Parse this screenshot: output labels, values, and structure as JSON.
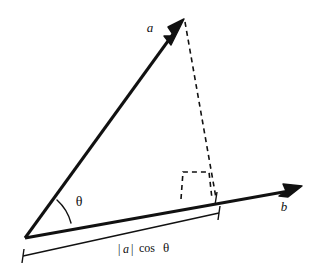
{
  "diagram": {
    "background_color": "#ffffff",
    "stroke_color": "#111111",
    "labels": {
      "vector_a": "a",
      "vector_b": "b",
      "angle_theta": "θ",
      "projection_magnitude": "|a| cos θ",
      "projection_magnitude_parts": {
        "abs_open": "|",
        "a": "a",
        "abs_close": "|",
        "cos": "cos",
        "theta": "θ"
      }
    },
    "geometry": {
      "origin": {
        "x": 25,
        "y": 238
      },
      "vector_a_tip": {
        "x": 184,
        "y": 19
      },
      "vector_b_tip": {
        "x": 302,
        "y": 186
      },
      "projection_foot": {
        "x": 216,
        "y": 198
      },
      "angle_arc_radius": 46,
      "right_angle_square": {
        "x": 181,
        "y": 171,
        "width": 28,
        "height": 28
      },
      "measure_bracket": {
        "start": {
          "x": 23,
          "y": 255
        },
        "end": {
          "x": 219,
          "y": 212
        }
      }
    },
    "styles": {
      "solid_line_width": 3,
      "dashed_line_width": 1.6,
      "dash_pattern": "5,4",
      "arc_line_width": 1.4,
      "bracket_line_width": 1.4,
      "label_font_size": 13,
      "theta_font_size": 13,
      "measure_font_size": 12
    }
  }
}
